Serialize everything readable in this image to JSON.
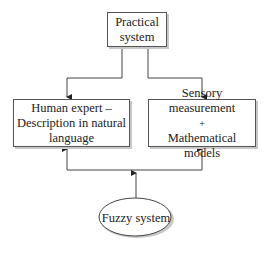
{
  "diagram": {
    "nodes": {
      "practical_system": {
        "lines": [
          "Practical",
          "system"
        ]
      },
      "human_expert": {
        "lines": [
          "Human expert –",
          "Description in natural",
          "language"
        ]
      },
      "sensory": {
        "lines": [
          "Sensory measurement",
          "+",
          "Mathematical models"
        ]
      },
      "fuzzy_system": {
        "label": "Fuzzy system"
      }
    },
    "edges": [
      {
        "from": "practical_system",
        "to": "human_expert"
      },
      {
        "from": "practical_system",
        "to": "sensory"
      },
      {
        "from": "fuzzy_system",
        "to": "human_expert"
      },
      {
        "from": "fuzzy_system",
        "to": "sensory"
      }
    ],
    "colors": {
      "line": "#444444",
      "shadow": "#c8c8c8"
    }
  }
}
